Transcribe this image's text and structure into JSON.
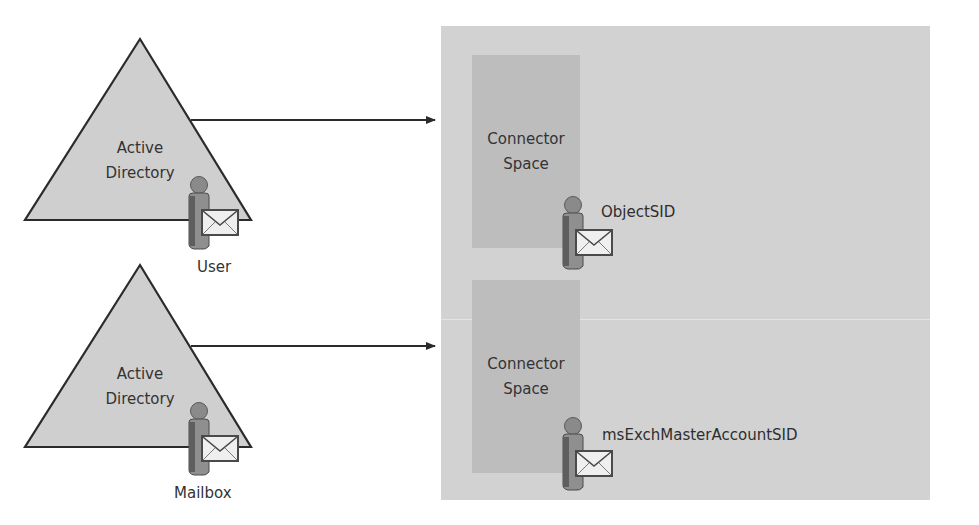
{
  "diagram": {
    "sources": [
      {
        "name": "Active Directory",
        "label_line1": "Active",
        "label_line2": "Directory",
        "object_label": "User",
        "icon": "user-mailbox-icon"
      },
      {
        "name": "Active Directory",
        "label_line1": "Active",
        "label_line2": "Directory",
        "object_label": "Mailbox",
        "icon": "user-mailbox-icon"
      }
    ],
    "connector_spaces": [
      {
        "label_line1": "Connector",
        "label_line2": "Space",
        "attribute": "ObjectSID",
        "icon": "user-mailbox-icon"
      },
      {
        "label_line1": "Connector",
        "label_line2": "Space",
        "attribute": "msExchMasterAccountSID",
        "icon": "user-mailbox-icon"
      }
    ],
    "edges": [
      {
        "from": "sources.0",
        "to": "connector_spaces.0",
        "type": "arrow"
      },
      {
        "from": "sources.1",
        "to": "connector_spaces.1",
        "type": "arrow"
      }
    ],
    "colors": {
      "triangle_fill": "#cfcfcf",
      "triangle_stroke": "#2b2b2b",
      "panel_fill": "#d2d2d2",
      "connector_fill": "#bdbdbd",
      "arrow": "#2b2b2b",
      "text": "#333333"
    }
  }
}
